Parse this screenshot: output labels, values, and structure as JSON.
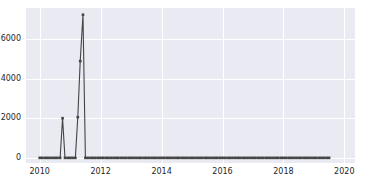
{
  "chart_data": {
    "type": "line",
    "title": "",
    "xlabel": "",
    "ylabel": "",
    "xlim": [
      2009.55,
      2020.35
    ],
    "ylim": [
      -260,
      7560
    ],
    "grid": true,
    "legend": "none",
    "line_color": "#444444",
    "marker": "square",
    "background_color": "#eaeaf2",
    "gridline_color": "#ffffff",
    "figure_background": "#ffffff",
    "xticks": [
      2010,
      2012,
      2014,
      2016,
      2018,
      2020
    ],
    "xtick_labels": [
      "2010",
      "2012",
      "2014",
      "2016",
      "2018",
      "2020"
    ],
    "yticks": [
      0,
      2000,
      4000,
      6000
    ],
    "ytick_labels": [
      "0",
      "2000",
      "4000",
      "6000"
    ],
    "x": [
      2010.0,
      2010.08,
      2010.17,
      2010.25,
      2010.33,
      2010.42,
      2010.5,
      2010.58,
      2010.67,
      2010.75,
      2010.83,
      2010.92,
      2011.0,
      2011.08,
      2011.17,
      2011.25,
      2011.33,
      2011.42,
      2011.5,
      2011.58,
      2011.67,
      2011.75,
      2011.83,
      2011.92,
      2012.0,
      2012.08,
      2012.17,
      2012.25,
      2012.33,
      2012.42,
      2012.5,
      2012.58,
      2012.67,
      2012.75,
      2012.83,
      2012.92,
      2013.0,
      2013.08,
      2013.17,
      2013.25,
      2013.33,
      2013.42,
      2013.5,
      2013.58,
      2013.67,
      2013.75,
      2013.83,
      2013.92,
      2014.0,
      2014.08,
      2014.17,
      2014.25,
      2014.33,
      2014.42,
      2014.5,
      2014.58,
      2014.67,
      2014.75,
      2014.83,
      2014.92,
      2015.0,
      2015.08,
      2015.17,
      2015.25,
      2015.33,
      2015.42,
      2015.5,
      2015.58,
      2015.67,
      2015.75,
      2015.83,
      2015.92,
      2016.0,
      2016.08,
      2016.17,
      2016.25,
      2016.33,
      2016.42,
      2016.5,
      2016.58,
      2016.67,
      2016.75,
      2016.83,
      2016.92,
      2017.0,
      2017.08,
      2017.17,
      2017.25,
      2017.33,
      2017.42,
      2017.5,
      2017.58,
      2017.67,
      2017.75,
      2017.83,
      2017.92,
      2018.0,
      2018.08,
      2018.17,
      2018.25,
      2018.33,
      2018.42,
      2018.5,
      2018.58,
      2018.67,
      2018.75,
      2018.83,
      2018.92,
      2019.0,
      2019.08,
      2019.17,
      2019.25,
      2019.33,
      2019.42,
      2019.5
    ],
    "values": [
      0,
      0,
      0,
      0,
      0,
      0,
      0,
      0,
      0,
      2000,
      0,
      0,
      0,
      0,
      0,
      2050,
      4880,
      7220,
      0,
      0,
      0,
      0,
      0,
      0,
      0,
      0,
      0,
      0,
      0,
      0,
      0,
      0,
      0,
      0,
      0,
      0,
      0,
      0,
      0,
      0,
      0,
      0,
      0,
      0,
      0,
      0,
      0,
      0,
      0,
      0,
      0,
      0,
      0,
      0,
      0,
      0,
      0,
      0,
      0,
      0,
      0,
      0,
      0,
      0,
      0,
      0,
      0,
      0,
      0,
      0,
      0,
      0,
      0,
      0,
      0,
      0,
      0,
      0,
      0,
      0,
      0,
      0,
      0,
      0,
      0,
      0,
      0,
      0,
      0,
      0,
      0,
      0,
      0,
      0,
      0,
      0,
      0,
      0,
      0,
      0,
      0,
      0,
      0,
      0,
      0,
      0,
      0,
      0,
      0,
      0,
      0,
      0,
      0,
      0,
      0
    ],
    "annotations": []
  }
}
